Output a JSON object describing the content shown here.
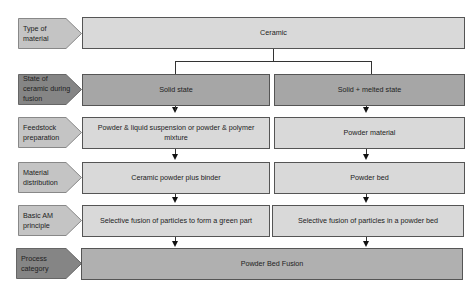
{
  "diagram": {
    "row_labels": [
      {
        "text": "Type of\nmaterial",
        "shade": "light"
      },
      {
        "text": "State of\nceramic during\nfusion",
        "shade": "dark"
      },
      {
        "text": "Feedstock\npreparation",
        "shade": "light"
      },
      {
        "text": "Material\ndistribution",
        "shade": "light"
      },
      {
        "text": "Basic AM\nprinciple",
        "shade": "light"
      },
      {
        "text": "Process\ncategory",
        "shade": "dark"
      }
    ],
    "material": "Ceramic",
    "left_branch": {
      "state": "Solid state",
      "feedstock": "Powder & liquid suspension or powder & polymer mixture",
      "distribution": "Ceramic powder plus binder",
      "principle": "Selective fusion of particles to form a green part"
    },
    "right_branch": {
      "state": "Solid + melted state",
      "feedstock": "Powder material",
      "distribution": "Powder bed",
      "principle": "Selective fusion of particles in a powder bed"
    },
    "process_category": "Powder Bed Fusion",
    "colors": {
      "light_fill": "#d9d9d9",
      "dark_fill": "#a6a6a6",
      "label_light": "#bfbfbf",
      "label_dark": "#7f7f7f",
      "border": "#555555"
    }
  }
}
